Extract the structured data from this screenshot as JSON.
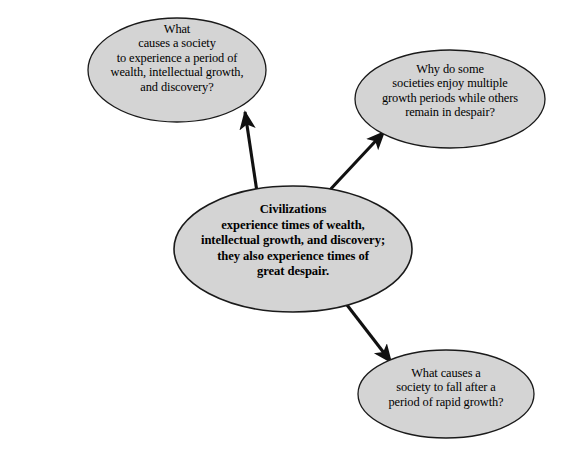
{
  "canvas": {
    "width": 571,
    "height": 454,
    "background_color": "#ffffff"
  },
  "style": {
    "ellipse_fill": "#d4d4d4",
    "ellipse_stroke": "#1a1a1a",
    "arrow_color": "#111111",
    "text_color": "#000000"
  },
  "diagram": {
    "type": "concept-map",
    "central_node": {
      "id": "central",
      "text": "Civilizations\nexperience times of wealth,\nintellectual growth, and discovery;\nthey also experience times of\ngreat despair.",
      "bold": true,
      "cx": 293,
      "cy": 249,
      "rx": 119,
      "ry": 63
    },
    "branch_nodes": [
      {
        "id": "question-growth-cause",
        "text": "What\ncauses a society\nto experience a period of\nwealth, intellectual growth,\nand discovery?",
        "cx": 177,
        "cy": 70,
        "rx": 89,
        "ry": 52
      },
      {
        "id": "question-multiple-periods",
        "text": "Why do some\nsocieties enjoy multiple\ngrowth periods while others\nremain in despair?",
        "cx": 450,
        "cy": 99,
        "rx": 95,
        "ry": 49
      },
      {
        "id": "question-fall-after-growth",
        "text": "What causes a\nsociety to fall after a\nperiod of rapid growth?",
        "cx": 446,
        "cy": 394,
        "rx": 88,
        "ry": 44
      }
    ],
    "arrows": [
      {
        "id": "arrow-to-growth-cause",
        "from": "central",
        "to": "question-growth-cause",
        "x1": 257,
        "y1": 192,
        "x2": 243,
        "y2": 110
      },
      {
        "id": "arrow-to-multiple-periods",
        "from": "central",
        "to": "question-multiple-periods",
        "x1": 327,
        "y1": 193,
        "x2": 386,
        "y2": 130
      },
      {
        "id": "arrow-to-fall-after-growth",
        "from": "central",
        "to": "question-fall-after-growth",
        "x1": 347,
        "y1": 305,
        "x2": 393,
        "y2": 364
      }
    ]
  },
  "artifacts": {
    "top_cutoff_line": ""
  }
}
